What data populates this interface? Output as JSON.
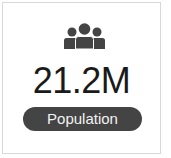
{
  "stat_card": {
    "icon": "people-group-icon",
    "value": "21.2M",
    "label": "Population",
    "colors": {
      "icon": "#444444",
      "value_text": "#1a1a1a",
      "pill_background": "#444444",
      "pill_text": "#f2f2f2",
      "border": "#d8d8d8"
    }
  }
}
